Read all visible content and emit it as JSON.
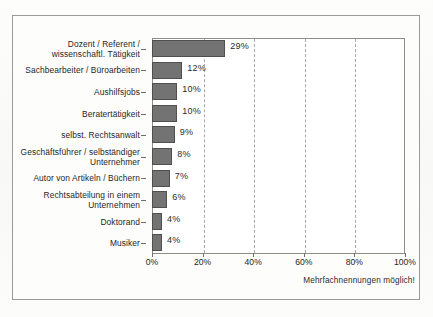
{
  "chart_data": {
    "type": "bar",
    "orientation": "horizontal",
    "title": "",
    "xlabel": "",
    "ylabel": "",
    "xlim": [
      0,
      100
    ],
    "grid": true,
    "legend": false,
    "xticks": [
      "0%",
      "20%",
      "40%",
      "60%",
      "80%",
      "100%"
    ],
    "xtick_values": [
      0,
      20,
      40,
      60,
      80,
      100
    ],
    "categories": [
      "Dozent / Referent /\nwissenschaftl. Tätigkeit",
      "Sachbearbeiter / Büroarbeiten",
      "Aushilfsjobs",
      "Beratertätigkeit",
      "selbst. Rechtsanwalt",
      "Geschäftsführer / selbständiger\nUnternehmer",
      "Autor von Artikeln / Büchern",
      "Rechtsabteilung in einem\nUnternehmen",
      "Doktorand",
      "Musiker"
    ],
    "values": [
      29,
      12,
      10,
      10,
      9,
      8,
      7,
      6,
      4,
      4
    ],
    "value_labels": [
      "29%",
      "12%",
      "10%",
      "10%",
      "9%",
      "8%",
      "7%",
      "6%",
      "4%",
      "4%"
    ],
    "annotation": "Mehrfachnennungen möglich!",
    "bar_color": "#737373",
    "bar_edge_color": "#4f4f4f",
    "grid_color": "#a9a9a6",
    "frame_color": "#8d8d8a"
  },
  "rows": [
    {
      "label_line1": "Dozent / Referent /",
      "label_line2": "wissenschaftl. Tätigkeit",
      "value": 29,
      "value_label": "29%"
    },
    {
      "label_line1": "Sachbearbeiter / Büroarbeiten",
      "label_line2": "",
      "value": 12,
      "value_label": "12%"
    },
    {
      "label_line1": "Aushilfsjobs",
      "label_line2": "",
      "value": 10,
      "value_label": "10%"
    },
    {
      "label_line1": "Beratertätigkeit",
      "label_line2": "",
      "value": 10,
      "value_label": "10%"
    },
    {
      "label_line1": "selbst. Rechtsanwalt",
      "label_line2": "",
      "value": 9,
      "value_label": "9%"
    },
    {
      "label_line1": "Geschäftsführer / selbständiger",
      "label_line2": "Unternehmer",
      "value": 8,
      "value_label": "8%"
    },
    {
      "label_line1": "Autor von Artikeln / Büchern",
      "label_line2": "",
      "value": 7,
      "value_label": "7%"
    },
    {
      "label_line1": "Rechtsabteilung in einem",
      "label_line2": "Unternehmen",
      "value": 6,
      "value_label": "6%"
    },
    {
      "label_line1": "Doktorand",
      "label_line2": "",
      "value": 4,
      "value_label": "4%"
    },
    {
      "label_line1": "Musiker",
      "label_line2": "",
      "value": 4,
      "value_label": "4%"
    }
  ],
  "footnote": "Mehrfachnennungen möglich!"
}
